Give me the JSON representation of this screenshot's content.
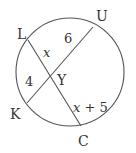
{
  "diagram": {
    "type": "circle-intersecting-chords",
    "points": {
      "L": "L",
      "U": "U",
      "K": "K",
      "C": "C",
      "Y": "Y"
    },
    "chords": [
      {
        "name": "chord-LC",
        "from": "L",
        "to": "C"
      },
      {
        "name": "chord-KU",
        "from": "K",
        "to": "U"
      }
    ],
    "segments": {
      "LY": "x",
      "YU": "6",
      "KY": "4",
      "YC_x": "x",
      "YC_rest": " + 5"
    },
    "stroke_color": "#555555"
  }
}
